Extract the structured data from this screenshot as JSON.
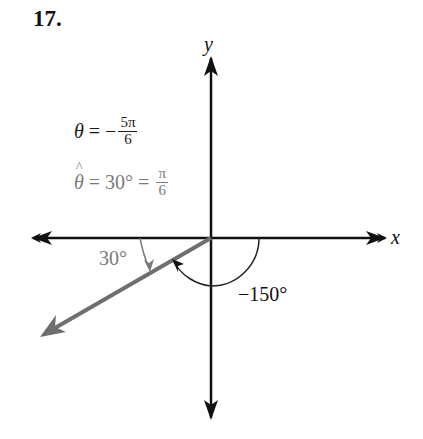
{
  "problem": {
    "number": "17."
  },
  "equations": {
    "theta": {
      "lhs": "θ",
      "eq": " = −",
      "num": "5π",
      "den": "6"
    },
    "ref_angle": {
      "lhs": "θ",
      "eq": " = 30° = ",
      "num": "π",
      "den": "6"
    }
  },
  "axes": {
    "x_label": "x",
    "y_label": "y"
  },
  "angle_labels": {
    "reference": "30°",
    "standard": "−150°"
  },
  "colors": {
    "axis": "#111111",
    "terminal_ray": "#6e6e6e",
    "reference_text": "#7a7a7a"
  }
}
